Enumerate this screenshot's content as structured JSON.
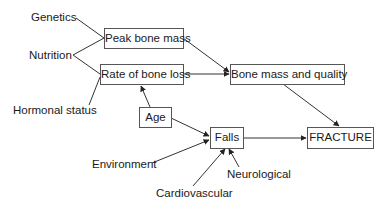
{
  "diagram": {
    "type": "flow",
    "title": "",
    "nodes": {
      "peak_bone_mass": "Peak bone mass",
      "rate_of_bone_loss": "Rate of bone loss",
      "bone_mass_quality": "Bone mass and quality",
      "age": "Age",
      "falls": "Falls",
      "fracture": "FRACTURE"
    },
    "factors": {
      "genetics": "Genetics",
      "nutrition": "Nutrition",
      "hormonal_status": "Hormonal status",
      "environment": "Environment",
      "cardiovascular": "Cardiovascular",
      "neurological": "Neurological"
    },
    "edges": [
      {
        "from": "Genetics",
        "to": "Peak bone mass",
        "arrow": false
      },
      {
        "from": "Nutrition",
        "to": "Peak bone mass",
        "arrow": false
      },
      {
        "from": "Nutrition",
        "to": "Rate of bone loss",
        "arrow": false
      },
      {
        "from": "Hormonal status",
        "to": "Rate of bone loss",
        "arrow": false
      },
      {
        "from": "Age",
        "to": "Rate of bone loss",
        "arrow": true
      },
      {
        "from": "Peak bone mass",
        "to": "Bone mass and quality",
        "arrow": true
      },
      {
        "from": "Rate of bone loss",
        "to": "Bone mass and quality",
        "arrow": true
      },
      {
        "from": "Bone mass and quality",
        "to": "FRACTURE",
        "arrow": true
      },
      {
        "from": "Age",
        "to": "Falls",
        "arrow": true
      },
      {
        "from": "Environment",
        "to": "Falls",
        "arrow": true
      },
      {
        "from": "Cardiovascular",
        "to": "Falls",
        "arrow": true
      },
      {
        "from": "Neurological",
        "to": "Falls",
        "arrow": true
      },
      {
        "from": "Falls",
        "to": "FRACTURE",
        "arrow": true
      }
    ],
    "colors": {
      "line": "#333333",
      "box_border": "#555555",
      "text": "#1a1a1a"
    }
  }
}
